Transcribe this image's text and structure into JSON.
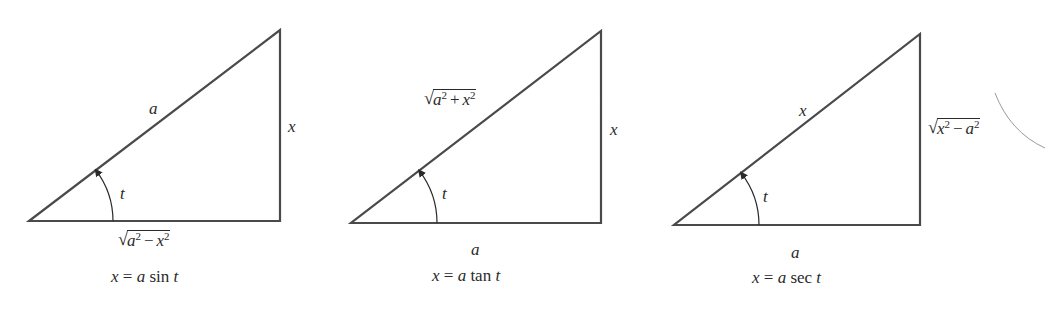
{
  "diagram": {
    "stroke_color": "#4a4a4a",
    "text_color": "#2a2a2a",
    "stroke_width": 2.2,
    "triangles": [
      {
        "id": "sin",
        "vertices": {
          "left": [
            29,
            221
          ],
          "right": [
            280,
            221
          ],
          "top": [
            280,
            30
          ]
        },
        "hypotenuse": {
          "var": "a",
          "pos": [
            149,
            100
          ]
        },
        "vertical": {
          "var": "x",
          "pos": [
            288,
            118
          ]
        },
        "base": {
          "radical": true,
          "a": "a",
          "op": "−",
          "b": "x",
          "exp": "2",
          "pos": [
            118,
            230
          ]
        },
        "angle": {
          "label": "t",
          "pos": [
            120,
            185
          ],
          "arc_radius": 84
        },
        "caption": {
          "lhs": "x",
          "eq": "=",
          "coef": "a",
          "fn": "sin",
          "arg": "t",
          "pos": [
            111,
            268
          ]
        }
      },
      {
        "id": "tan",
        "vertices": {
          "left": [
            351,
            223
          ],
          "right": [
            601,
            223
          ],
          "top": [
            601,
            31
          ]
        },
        "hypotenuse": {
          "radical": true,
          "a": "a",
          "op": "+",
          "b": "x",
          "exp": "2",
          "pos": [
            424,
            89
          ]
        },
        "vertical": {
          "var": "x",
          "pos": [
            610,
            121
          ]
        },
        "base": {
          "var": "a",
          "pos": [
            471,
            241
          ]
        },
        "angle": {
          "label": "t",
          "pos": [
            442,
            185
          ],
          "arc_radius": 86
        },
        "caption": {
          "lhs": "x",
          "eq": "=",
          "coef": "a",
          "fn": "tan",
          "arg": "t",
          "pos": [
            432,
            267
          ]
        }
      },
      {
        "id": "sec",
        "vertices": {
          "left": [
            674,
            225
          ],
          "right": [
            920,
            225
          ],
          "top": [
            920,
            34
          ]
        },
        "hypotenuse": {
          "var": "x",
          "pos": [
            799,
            102
          ]
        },
        "vertical": {
          "radical": true,
          "a": "x",
          "op": "−",
          "b": "a",
          "exp": "2",
          "pos": [
            928,
            118
          ]
        },
        "base": {
          "var": "a",
          "pos": [
            791,
            244
          ]
        },
        "angle": {
          "label": "t",
          "pos": [
            763,
            188
          ],
          "arc_radius": 85
        },
        "caption": {
          "lhs": "x",
          "eq": "=",
          "coef": "a",
          "fn": "sec",
          "arg": "t",
          "pos": [
            752,
            269
          ]
        }
      }
    ],
    "artifacts": {
      "arc_fragment": {
        "path": "M 995 93 Q 1010 132 1045 148",
        "color": "#9a9a9a"
      }
    }
  }
}
